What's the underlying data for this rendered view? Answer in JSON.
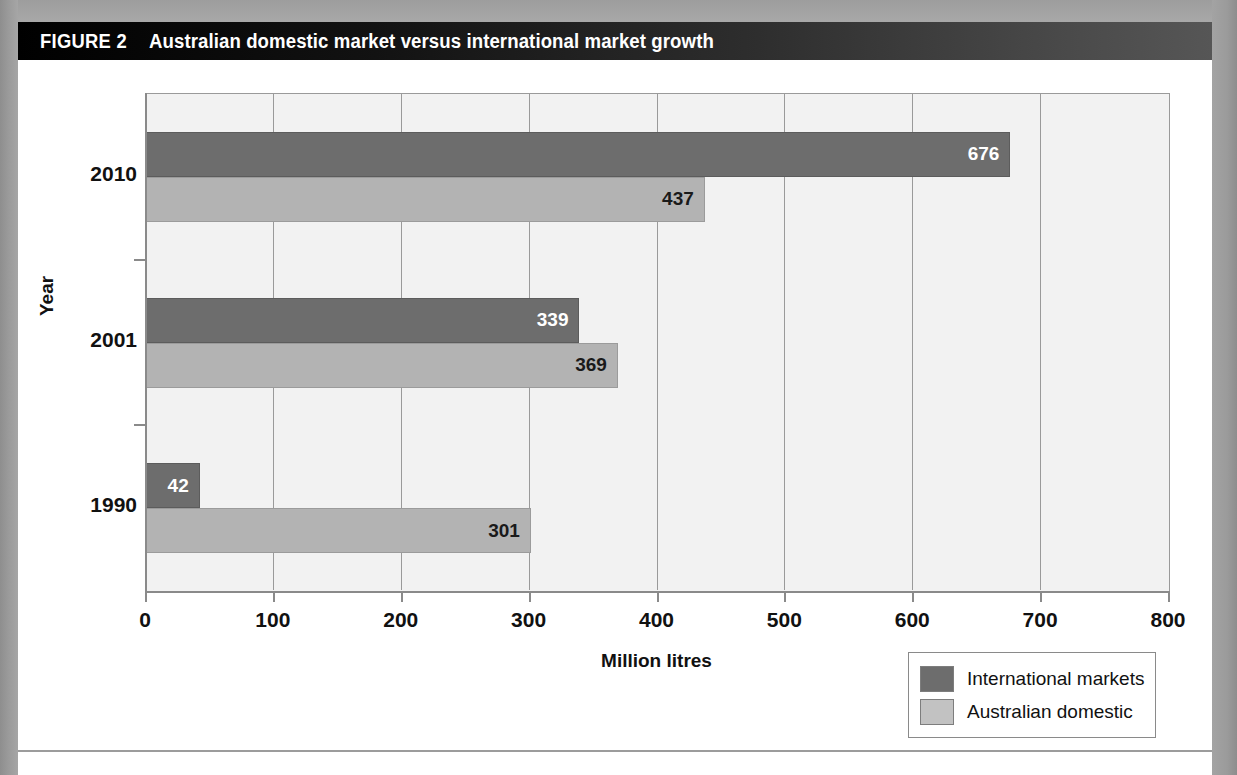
{
  "figure": {
    "label": "FIGURE 2",
    "title": "Australian domestic market versus international market growth"
  },
  "colors": {
    "header_bar": "#000000",
    "international": "#6d6d6d",
    "domestic": "#b3b3b3",
    "plot_background": "#f2f2f2",
    "gridline": "#9a9a9a",
    "axis": "#8a8a8a"
  },
  "chart_data": {
    "type": "bar",
    "orientation": "horizontal",
    "title": "Australian domestic market versus international market growth",
    "categories": [
      "2010",
      "2001",
      "1990"
    ],
    "series": [
      {
        "name": "International markets",
        "values": [
          676,
          339,
          42
        ],
        "color": "#6d6d6d"
      },
      {
        "name": "Australian domestic",
        "values": [
          437,
          369,
          301
        ],
        "color": "#b3b3b3"
      }
    ],
    "xlabel": "Million litres",
    "ylabel": "Year",
    "xlim": [
      0,
      800
    ],
    "xticks": [
      0,
      100,
      200,
      300,
      400,
      500,
      600,
      700,
      800
    ],
    "xtick_labels": [
      "0",
      "100",
      "200",
      "300",
      "400",
      "500",
      "600",
      "700",
      "800"
    ],
    "grid": "vertical",
    "legend_position": "bottom-right",
    "data_labels": true
  },
  "legend": {
    "entries": [
      {
        "label": "International markets",
        "swatch": "international-swatch"
      },
      {
        "label": "Australian domestic",
        "swatch": "domestic-swatch"
      }
    ]
  }
}
